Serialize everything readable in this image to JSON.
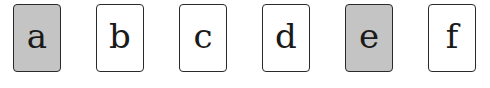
{
  "cards": [
    {
      "label": "a",
      "shaded": true,
      "left": 13
    },
    {
      "label": "b",
      "shaded": false,
      "left": 96
    },
    {
      "label": "c",
      "shaded": false,
      "left": 179
    },
    {
      "label": "d",
      "shaded": false,
      "left": 262
    },
    {
      "label": "e",
      "shaded": true,
      "left": 345
    },
    {
      "label": "f",
      "shaded": false,
      "left": 428
    }
  ],
  "colors": {
    "shaded_fill": "#c4c4c4",
    "plain_fill": "#ffffff",
    "border": "#2a2a2a"
  }
}
